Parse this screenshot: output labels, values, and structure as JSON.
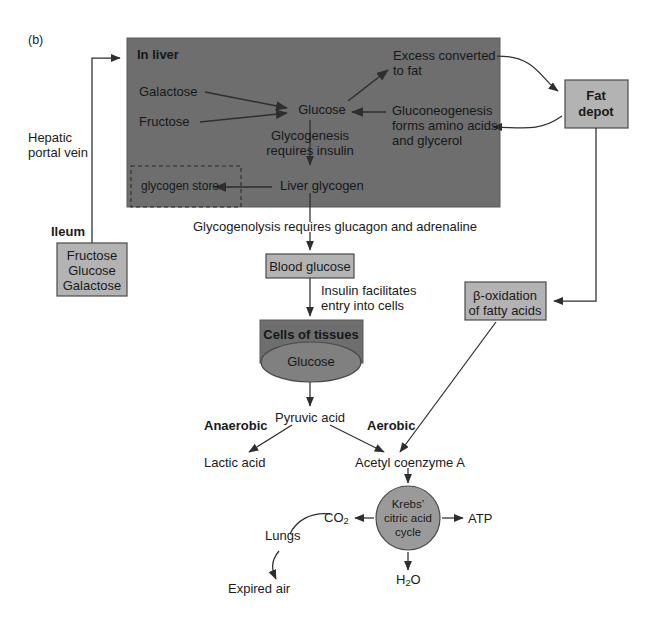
{
  "figure": {
    "panel_label": "(b)",
    "type": "metabolic-pathway-flow-diagram"
  },
  "colors": {
    "dark_fill": "#6e6e6e",
    "light_fill": "#b3b3b3",
    "stroke": "#4a4a4a",
    "line": "#3a3a3a",
    "text_dark": "#1a1a1a",
    "background": "#ffffff"
  },
  "liver_panel": {
    "title": "In liver",
    "nodes": {
      "galactose": "Galactose",
      "fructose": "Fructose",
      "glucose": "Glucose",
      "excess_to_fat": "Excess converted\nto fat",
      "excess_to_fat_line1": "Excess converted",
      "excess_to_fat_line2": "to fat",
      "gluconeogenesis_line1": "Gluconeogenesis",
      "gluconeogenesis_line2": "forms amino acids",
      "gluconeogenesis_line3": "and glycerol",
      "glycogenesis_line1": "Glycogenesis",
      "glycogenesis_line2": "requires insulin",
      "liver_glycogen": "Liver glycogen",
      "glycogen_store": "glycogen store"
    }
  },
  "vessels": {
    "hepatic_portal_vein_line1": "Hepatic",
    "hepatic_portal_vein_line2": "portal vein"
  },
  "ileum": {
    "label": "Ileum",
    "contents": [
      "Fructose",
      "Glucose",
      "Galactose"
    ]
  },
  "fat_depot": {
    "line1": "Fat",
    "line2": "depot"
  },
  "beta_oxidation": {
    "line1": "β-oxidation",
    "line2": "of fatty acids"
  },
  "blood": {
    "blood_glucose": "Blood glucose",
    "glycogenolysis_note": "Glycogenolysis requires glucagon and adrenaline",
    "insulin_note_line1": "Insulin facilitates",
    "insulin_note_line2": "entry into cells"
  },
  "tissues": {
    "title": "Cells of tissues",
    "glucose": "Glucose",
    "pyruvic_acid": "Pyruvic acid",
    "anaerobic": "Anaerobic",
    "aerobic": "Aerobic",
    "lactic_acid": "Lactic acid",
    "acetyl_coenzyme_a": "Acetyl coenzyme A"
  },
  "krebs": {
    "line1": "Krebs’",
    "line2": "citric acid",
    "line3": "cycle",
    "outputs": {
      "atp": "ATP",
      "co2_text": "CO",
      "co2_sub": "2",
      "water_text": "H",
      "water_sub": "2",
      "water_tail": "O"
    }
  },
  "respiration": {
    "lungs": "Lungs",
    "expired_air": "Expired air"
  }
}
